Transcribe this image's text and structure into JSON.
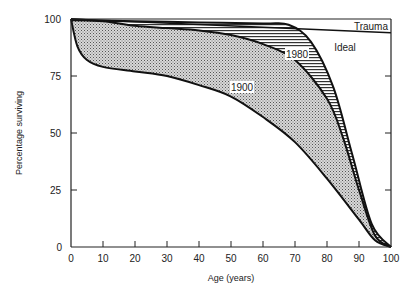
{
  "chart_data": {
    "type": "area",
    "title": "",
    "xlabel": "Age (years)",
    "ylabel": "Percentage surviving",
    "xlim": [
      0,
      100
    ],
    "ylim": [
      0,
      100
    ],
    "x_ticks": [
      "0",
      "10",
      "20",
      "30",
      "40",
      "50",
      "60",
      "70",
      "80",
      "90",
      "100"
    ],
    "y_ticks": [
      "0",
      "25",
      "50",
      "75",
      "100"
    ],
    "grid": false,
    "legend": "inline labels",
    "series": [
      {
        "name": "1900",
        "fill": "stippled",
        "x": [
          0,
          2,
          5,
          10,
          20,
          30,
          40,
          50,
          60,
          70,
          80,
          90,
          95,
          100
        ],
        "values": [
          100,
          88,
          82,
          79,
          77,
          75,
          71,
          66,
          57,
          46,
          30,
          12,
          3,
          0
        ]
      },
      {
        "name": "1980",
        "fill": "horizontal-hatch",
        "x": [
          0,
          10,
          20,
          30,
          40,
          50,
          60,
          70,
          80,
          85,
          90,
          95,
          100
        ],
        "values": [
          100,
          99,
          97,
          96,
          95,
          93,
          89,
          82,
          65,
          48,
          25,
          5,
          0
        ]
      },
      {
        "name": "Ideal",
        "fill": "none",
        "x": [
          0,
          20,
          40,
          60,
          68,
          75,
          82,
          88,
          94,
          100
        ],
        "values": [
          99.5,
          99,
          98.5,
          98,
          97.5,
          90,
          70,
          40,
          10,
          0
        ]
      },
      {
        "name": "Trauma",
        "fill": "none",
        "x": [
          0,
          100
        ],
        "values": [
          100,
          94
        ]
      }
    ],
    "annotations": [
      {
        "text": "Trauma",
        "x": 96,
        "y": 97
      },
      {
        "text": "Ideal",
        "x": 88,
        "y": 89
      },
      {
        "text": "1980",
        "x": 77,
        "y": 89
      },
      {
        "text": "1900",
        "x": 54,
        "y": 69
      }
    ]
  },
  "labels": {
    "xlabel": "Age (years)",
    "ylabel": "Percentage surviving",
    "trauma": "Trauma",
    "ideal": "Ideal",
    "s1980": "1980",
    "s1900": "1900",
    "xt": [
      "0",
      "10",
      "20",
      "30",
      "40",
      "50",
      "60",
      "70",
      "80",
      "90",
      "100"
    ],
    "yt": [
      "0",
      "25",
      "50",
      "75",
      "100"
    ]
  }
}
